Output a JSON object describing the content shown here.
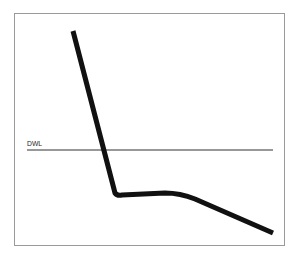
{
  "diagram": {
    "waterline_label": "DWL",
    "colors": {
      "frame": "#9a9a9a",
      "curve": "#111111",
      "waterline": "#333333",
      "background": "#ffffff"
    }
  }
}
